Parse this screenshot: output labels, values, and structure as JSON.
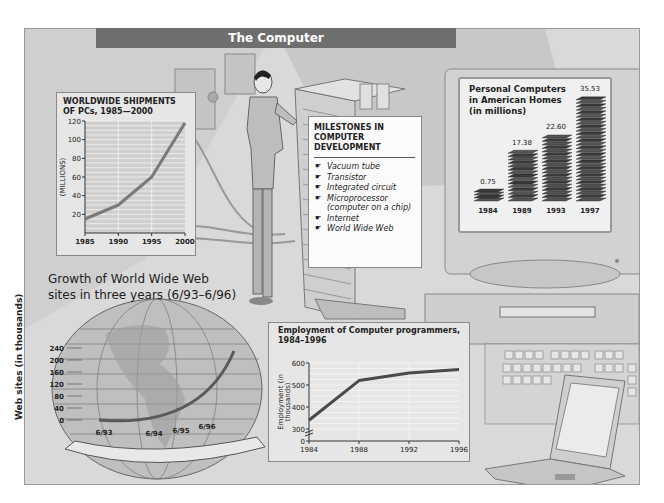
{
  "page": {
    "title": "The Computer"
  },
  "milestones": {
    "title_lines": [
      "MILESTONES IN",
      "COMPUTER",
      "DEVELOPMENT"
    ],
    "bullet_icon": "pointing-hand-icon",
    "items": [
      "Vacuum tube",
      "Transistor",
      "Integrated circuit",
      "Microprocessor (computer on a chip)",
      "Internet",
      "World Wide Web"
    ]
  },
  "illustration": {
    "elements": [
      "technician-figure",
      "mainframe-cabinet",
      "desktop-monitor",
      "keyboard",
      "laptop",
      "globe"
    ]
  },
  "chart_data": [
    {
      "id": "shipments",
      "type": "line",
      "title": "WORLDWIDE SHIPMENTS OF PCs, 1985—2000",
      "title_lines": [
        "WORLDWIDE SHIPMENTS",
        "OF PCs, 1985—2000"
      ],
      "xlabel": "",
      "ylabel": "(MILLIONS)",
      "x": [
        1985,
        1990,
        1995,
        2000
      ],
      "values": [
        15,
        30,
        60,
        118
      ],
      "xticks": [
        "1985",
        "1990",
        "1995",
        "2000"
      ],
      "yticks": [
        20,
        40,
        60,
        80,
        100,
        120
      ],
      "ylim": [
        0,
        120
      ],
      "grid": true,
      "color": "#7a7a7a"
    },
    {
      "id": "home-pcs",
      "type": "bar",
      "title": "Personal Computers in American Homes (in millions)",
      "title_lines": [
        "Personal Computers",
        "in American Homes",
        "(in millions)"
      ],
      "categories": [
        "1984",
        "1989",
        "1993",
        "1997"
      ],
      "values": [
        0.75,
        17.38,
        22.6,
        35.53
      ],
      "value_labels": [
        "0.75",
        "17.38",
        "22.60",
        "35.53"
      ],
      "bar_style": "stacked-computers"
    },
    {
      "id": "web-sites",
      "type": "line",
      "title": "Growth of World Wide Web sites in three years (6/93–6/96)",
      "title_lines": [
        "Growth of World Wide Web",
        "sites in three years (6/93–6/96)"
      ],
      "ylabel": "Web sites (in thousands)",
      "categories": [
        "6/93",
        "6/94",
        "6/95",
        "6/96"
      ],
      "values": [
        0,
        5,
        40,
        230
      ],
      "yticks": [
        0,
        40,
        80,
        120,
        160,
        200,
        240
      ],
      "ylim": [
        0,
        240
      ],
      "background": "globe"
    },
    {
      "id": "employment",
      "type": "line",
      "title": "Employment of Computer programmers, 1984–1996",
      "title_lines": [
        "Employment of Computer programmers,",
        "1984–1996"
      ],
      "ylabel": "Employment (in thousands)",
      "x": [
        1984,
        1988,
        1992,
        1996
      ],
      "values": [
        340,
        520,
        555,
        570
      ],
      "xticks": [
        "1984",
        "1988",
        "1992",
        "1996"
      ],
      "yticks": [
        0,
        300,
        400,
        500,
        600
      ],
      "ylim": [
        250,
        600
      ],
      "axis_break": true,
      "grid": true,
      "color": "#4a4a4a"
    }
  ]
}
